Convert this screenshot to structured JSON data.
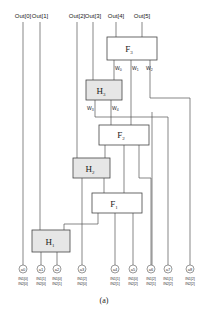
{
  "outputs": [
    "Out[0]",
    "Out[1]",
    "Out[2]",
    "Out[3]",
    "Out[4]",
    "Out[5]"
  ],
  "blocks": {
    "F3": {
      "label": "F",
      "sub": "3"
    },
    "H3": {
      "label": "H",
      "sub": "3"
    },
    "F2": {
      "label": "F",
      "sub": "2"
    },
    "H2": {
      "label": "H",
      "sub": "2"
    },
    "F1": {
      "label": "F",
      "sub": "1"
    },
    "H1": {
      "label": "H",
      "sub": "1"
    }
  },
  "wires": [
    "W0",
    "W1",
    "W2",
    "W3",
    "W4"
  ],
  "wire_labels": [
    {
      "w": "W",
      "sub": "0"
    },
    {
      "w": "W",
      "sub": "1"
    },
    {
      "w": "W",
      "sub": "2"
    },
    {
      "w": "W",
      "sub": "3"
    },
    {
      "w": "W",
      "sub": "4"
    }
  ],
  "inputs": [
    {
      "node": "a0",
      "in1": "IN1[0]",
      "in2": "IN2[0]"
    },
    {
      "node": "a1",
      "in1": "IN1[1]",
      "in2": "IN2[0]"
    },
    {
      "node": "a2",
      "in1": "IN1[0]",
      "in2": "IN2[1]"
    },
    {
      "node": "a3",
      "in1": "IN1[2]",
      "in2": "IN2[0]"
    },
    {
      "node": "a4",
      "in1": "IN1[1]",
      "in2": "IN2[1]"
    },
    {
      "node": "a5",
      "in1": "IN1[0]",
      "in2": "IN2[2]"
    },
    {
      "node": "a6",
      "in1": "IN1[2]",
      "in2": "IN2[1]"
    },
    {
      "node": "a7",
      "in1": "IN1[1]",
      "in2": "IN2[2]"
    },
    {
      "node": "a8",
      "in1": "IN1[2]",
      "in2": "IN2[2]"
    }
  ],
  "caption": "(a)",
  "colors": {
    "line": "#555555",
    "box_fill": "#ffffff",
    "half_fill": "#e6e6e6"
  }
}
